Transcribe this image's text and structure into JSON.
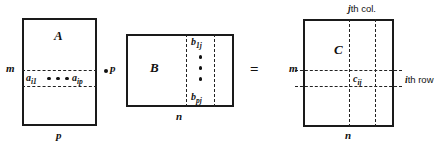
{
  "figure": {
    "type": "matrix-multiplication-diagram",
    "equation": "A · B = C"
  },
  "matrix_a": {
    "name": "A",
    "rows_label": "m",
    "cols_label": "p",
    "row_entries": {
      "first": "a",
      "first_sub": "i1",
      "last": "a",
      "last_sub": "ip",
      "ellipsis": "•••"
    }
  },
  "operator_multiply": "·",
  "matrix_b": {
    "name": "B",
    "rows_label": "p",
    "cols_label": "n",
    "col_entries": {
      "first": "b",
      "first_sub": "1j",
      "last": "b",
      "last_sub": "pj",
      "ellipsis": "⋮"
    }
  },
  "operator_equals": "=",
  "matrix_c": {
    "name": "C",
    "rows_label": "m",
    "cols_label": "n",
    "entry": "c",
    "entry_sub": "ij",
    "annotation_col": "th col.",
    "annotation_col_index": "j",
    "annotation_row": "th row",
    "annotation_row_index": "i"
  },
  "colors": {
    "stroke": "#1a1a1a",
    "dashed": "#222222",
    "background": "#ffffff"
  }
}
